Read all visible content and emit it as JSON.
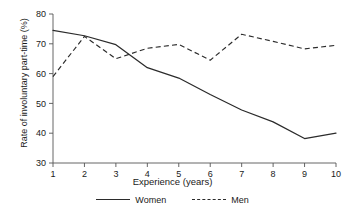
{
  "chart_data": {
    "type": "line",
    "title": "",
    "xlabel": "Experience (years)",
    "ylabel": "Rate of involuntary part-time (%)",
    "x": [
      1,
      2,
      3,
      4,
      5,
      6,
      7,
      8,
      9,
      10
    ],
    "xlim": [
      1,
      10
    ],
    "ylim": [
      30,
      80
    ],
    "xticks": [
      "1",
      "2",
      "3",
      "4",
      "5",
      "6",
      "7",
      "8",
      "9",
      "10"
    ],
    "yticks": [
      "30",
      "40",
      "50",
      "60",
      "70",
      "80"
    ],
    "grid": false,
    "legend_position": "bottom",
    "series": [
      {
        "name": "Women",
        "style": "solid",
        "color": "#2b2b2b",
        "values": [
          74.5,
          72.7,
          69.7,
          62.0,
          58.5,
          53.0,
          47.8,
          43.8,
          38.2,
          40.0
        ]
      },
      {
        "name": "Men",
        "style": "dashed",
        "color": "#2b2b2b",
        "values": [
          59.0,
          72.5,
          65.0,
          68.5,
          69.8,
          64.5,
          73.2,
          70.8,
          68.3,
          69.5
        ]
      }
    ]
  },
  "legend": {
    "items": [
      {
        "label": "Women"
      },
      {
        "label": "Men"
      }
    ]
  }
}
